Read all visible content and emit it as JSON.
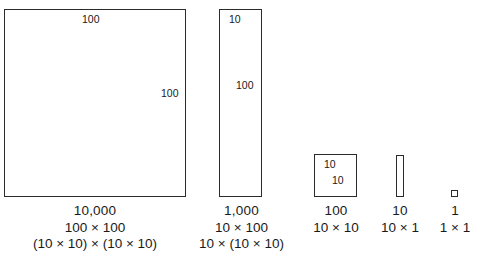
{
  "figure": {
    "background_color": "#ffffff",
    "stroke_color": "#2b2b2b",
    "text_color": "#1a1a1a"
  },
  "shapes": {
    "big_square": {
      "top_label": "100",
      "right_label": "100"
    },
    "tall_rect": {
      "top_label": "10",
      "right_label": "100"
    },
    "medium_square": {
      "top_label": "10",
      "right_label": "10"
    },
    "thin_bar": {},
    "unit_square": {}
  },
  "captions": [
    {
      "value": "10,000",
      "factored": "100 × 100",
      "expanded": "(10 × 10) × (10 × 10)"
    },
    {
      "value": "1,000",
      "factored": "10 × 100",
      "expanded": "10 × (10 × 10)"
    },
    {
      "value": "100",
      "factored": "10 × 10",
      "expanded": ""
    },
    {
      "value": "10",
      "factored": "10 × 1",
      "expanded": ""
    },
    {
      "value": "1",
      "factored": "1 × 1",
      "expanded": ""
    }
  ],
  "chart_data": {
    "type": "bar",
    "categories": [
      "10,000",
      "1,000",
      "100",
      "10",
      "1"
    ],
    "values": [
      10000,
      1000,
      100,
      10,
      1
    ],
    "widths": [
      100,
      10,
      10,
      1,
      1
    ],
    "heights": [
      100,
      100,
      10,
      10,
      1
    ],
    "xlabel": "",
    "ylabel": "",
    "grid": false,
    "legend": "none"
  }
}
